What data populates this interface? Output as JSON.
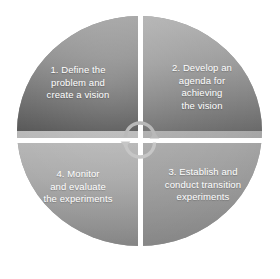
{
  "diagram": {
    "type": "cycle-quadrant-diagram",
    "shape": "circle",
    "segment_count": 4,
    "center_icon": "cycle-arrows-icon",
    "divider_color": "#ffffff",
    "text_color": "#ffffff",
    "background_color": "#ffffff",
    "segments": [
      {
        "number": "1",
        "position": "top-left",
        "label": "1. Define the\nproblem and\ncreate a vision",
        "color_top": "#a3a3a3",
        "color_bottom": "#545454"
      },
      {
        "number": "2",
        "position": "top-right",
        "label": "2. Develop an\nagenda for\nachieving\nthe vision",
        "color_top": "#b2b2b2",
        "color_bottom": "#6c6c6c"
      },
      {
        "number": "3",
        "position": "bottom-right",
        "label": "3. Establish and\nconduct transition\nexperiments",
        "color_top": "#ababab",
        "color_bottom": "#898989"
      },
      {
        "number": "4",
        "position": "bottom-left",
        "label": "4. Monitor\nand evaluate\nthe experiments",
        "color_top": "#b8b8b8",
        "color_bottom": "#878787"
      }
    ]
  }
}
